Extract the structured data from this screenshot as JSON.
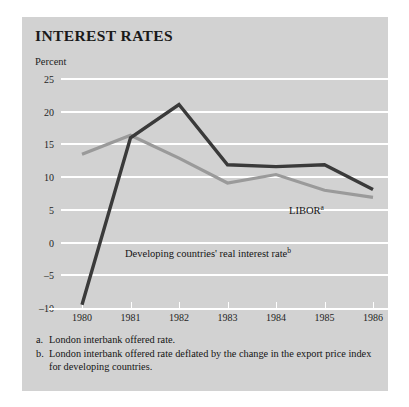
{
  "figure": {
    "title": "INTEREST RATES",
    "y_axis_title": "Percent"
  },
  "chart_data": {
    "type": "line",
    "title": "INTEREST RATES",
    "xlabel": "",
    "ylabel": "Percent",
    "x": [
      1980,
      1981,
      1982,
      1983,
      1984,
      1985,
      1986
    ],
    "xticklabels": [
      "1980",
      "1981",
      "1982",
      "1983",
      "1984",
      "1985",
      "1986"
    ],
    "yticklabels": [
      "25",
      "20",
      "15",
      "10",
      "5",
      "0",
      "-5",
      "-10"
    ],
    "ylim": [
      -10,
      25
    ],
    "ytick_values": [
      25,
      20,
      15,
      10,
      5,
      0,
      -5,
      -10
    ],
    "grid": "horizontal",
    "legend": "inline-labels",
    "series": [
      {
        "name": "LIBOR",
        "label": "LIBOR",
        "label_superscript": "a",
        "color": "#9a9a9a",
        "values": [
          13.5,
          16.4,
          12.9,
          9.1,
          10.4,
          8.0,
          6.9
        ]
      },
      {
        "name": "Developing countries' real interest rate",
        "label": "Developing countries' real interest rate",
        "label_superscript": "b",
        "color": "#3a3a3a",
        "values": [
          -9.5,
          16.0,
          21.1,
          11.9,
          11.6,
          11.9,
          8.1
        ]
      }
    ]
  },
  "footnotes": [
    {
      "marker": "a.",
      "text": "London interbank offered rate."
    },
    {
      "marker": "b.",
      "text": "London interbank offered rate deflated by the change in the export price index for developing countries."
    }
  ]
}
